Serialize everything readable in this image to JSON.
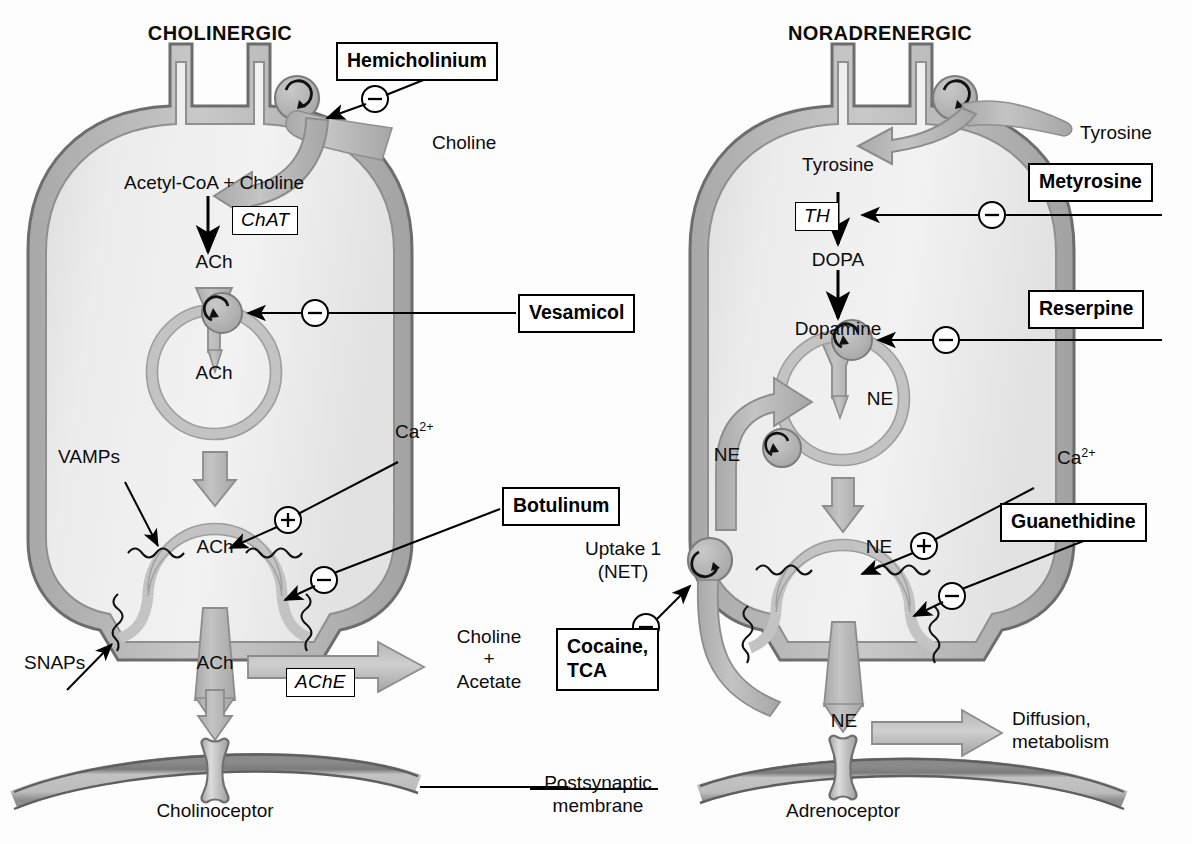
{
  "figure": {
    "type": "diagram"
  },
  "panels": [
    {
      "id": "cholinergic",
      "title": "CHOLINERGIC",
      "transmitter": "ACh"
    },
    {
      "id": "noradrenergic",
      "title": "NORADRENERGIC",
      "transmitter": "NE"
    }
  ],
  "cholinergic": {
    "title": "CHOLINERGIC",
    "uptake_substrate": "Choline",
    "synthesis_precursors": "Acetyl-CoA + Choline",
    "synthesis_enzyme": "ChAT",
    "cytoplasmic_transmitter": "ACh",
    "vesicle_transmitter": "ACh",
    "fusing_vesicle_transmitter": "ACh",
    "cleft_transmitter": "ACh",
    "calcium": "Ca",
    "calcium_charge": "2+",
    "calcium_sign": "+",
    "vamps_label": "VAMPs",
    "snaps_label": "SNAPs",
    "degradation_enzyme": "AChE",
    "degradation_products_line1": "Choline",
    "degradation_products_line2": "+",
    "degradation_products_line3": "Acetate",
    "receptor_label": "Cholinoceptor",
    "drugs": [
      {
        "name": "hemicholinium",
        "label": "Hemicholinium",
        "sign": "−",
        "target": "choline-transporter"
      },
      {
        "name": "vesamicol",
        "label": "Vesamicol",
        "sign": "−",
        "target": "vesicular-ach-transporter"
      },
      {
        "name": "botulinum",
        "label": "Botulinum",
        "sign": "−",
        "target": "vesicle-fusion-snare"
      }
    ]
  },
  "noradrenergic": {
    "title": "NORADRENERGIC",
    "uptake_substrate": "Tyrosine",
    "intracellular_precursor": "Tyrosine",
    "synthesis_enzyme": "TH",
    "intermediate_1": "DOPA",
    "intermediate_2": "Dopamine",
    "vesicle_transmitter": "NE",
    "recycled_transmitter": "NE",
    "fusing_vesicle_transmitter": "NE",
    "cleft_transmitter": "NE",
    "calcium": "Ca",
    "calcium_charge": "2+",
    "calcium_sign": "+",
    "uptake_label_line1": "Uptake 1",
    "uptake_label_line2": "(NET)",
    "removal_line1": "Diffusion,",
    "removal_line2": "metabolism",
    "receptor_label": "Adrenoceptor",
    "drugs": [
      {
        "name": "metyrosine",
        "label": "Metyrosine",
        "sign": "−",
        "target": "tyrosine-hydroxylase"
      },
      {
        "name": "reserpine",
        "label": "Reserpine",
        "sign": "−",
        "target": "vmat"
      },
      {
        "name": "guanethidine",
        "label": "Guanethidine",
        "sign": "−",
        "target": "vesicle-fusion"
      },
      {
        "name": "cocaine-tca",
        "label_line1": "Cocaine,",
        "label_line2": "TCA",
        "sign": "−",
        "target": "net-reuptake"
      }
    ]
  },
  "shared": {
    "postsynaptic_membrane_line1": "Postsynaptic",
    "postsynaptic_membrane_line2": "membrane"
  },
  "colors": {
    "membrane_fill": "#b9b9b9",
    "membrane_line": "#6f6f6f",
    "cytoplasm": "#e9e9e9",
    "vesicle_band": "#c6c6c6",
    "arrow_fill": "#b6b6b6",
    "arrow_stroke": "#8d8d8d",
    "transporter_fill": "#b2b2b2",
    "text": "#0c0c0c",
    "box_border": "#000000",
    "background": "#ffffff"
  }
}
